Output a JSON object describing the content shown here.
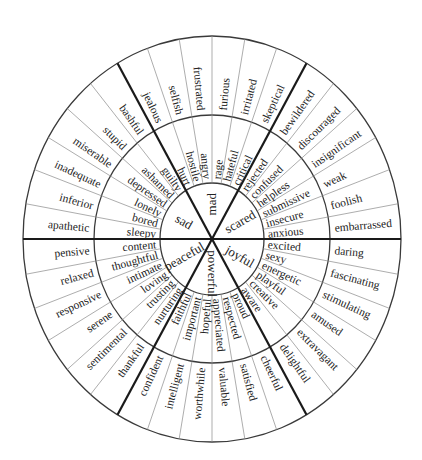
{
  "geometry": {
    "cx": 212,
    "cy": 239,
    "rx": [
      52,
      118,
      189
    ],
    "ry": [
      56,
      124,
      203
    ]
  },
  "colors": {
    "line": "#1a1a1a",
    "thin": "#8a8a8a",
    "text": "#222222",
    "background": "#ffffff"
  },
  "sectors": [
    {
      "core": "scared",
      "start_angle": 0,
      "end_angle": 60,
      "middle": [
        "anxious",
        "insecure",
        "submissive",
        "helpless",
        "confused",
        "rejected"
      ],
      "outer": [
        "embarrassed",
        "foolish",
        "weak",
        "insignificant",
        "discouraged",
        "bewildered"
      ]
    },
    {
      "core": "mad",
      "start_angle": 60,
      "end_angle": 120,
      "middle": [
        "critical",
        "hateful",
        "rage",
        "angry",
        "hostile",
        "hurt"
      ],
      "outer": [
        "skeptical",
        "irritated",
        "furious",
        "frustrated",
        "selfish",
        "jealous"
      ]
    },
    {
      "core": "sad",
      "start_angle": 120,
      "end_angle": 180,
      "middle": [
        "guilty",
        "ashamed",
        "depressed",
        "lonely",
        "bored",
        "sleepy"
      ],
      "outer": [
        "bashful",
        "stupid",
        "miserable",
        "inadequate",
        "inferior",
        "apathetic"
      ]
    },
    {
      "core": "peaceful",
      "start_angle": 180,
      "end_angle": 240,
      "middle": [
        "content",
        "thoughtful",
        "intimate",
        "loving",
        "trusting",
        "nurturing"
      ],
      "outer": [
        "pensive",
        "relaxed",
        "responsive",
        "serene",
        "sentimental",
        "thankful"
      ]
    },
    {
      "core": "powerful",
      "start_angle": 240,
      "end_angle": 300,
      "middle": [
        "faithful",
        "important",
        "hopeful",
        "appreciated",
        "respected",
        "proud"
      ],
      "outer": [
        "confident",
        "intelligent",
        "worthwhile",
        "valuable",
        "satisfied",
        "cheerful"
      ]
    },
    {
      "core": "joyful",
      "start_angle": 300,
      "end_angle": 360,
      "middle": [
        "aware",
        "creative",
        "playful",
        "energetic",
        "sexy",
        "excited"
      ],
      "outer": [
        "delightful",
        "extravagant",
        "amused",
        "stimulating",
        "fascinating",
        "daring"
      ]
    }
  ]
}
